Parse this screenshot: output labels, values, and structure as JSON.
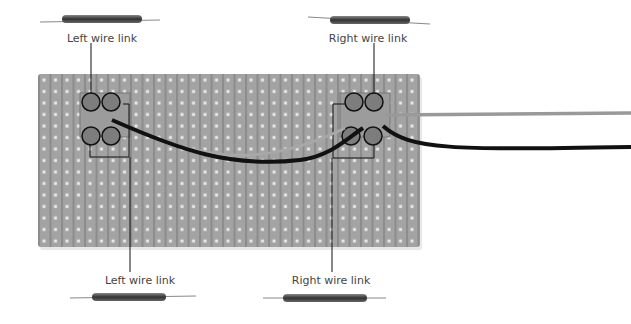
{
  "labels": {
    "top_left": "Left wire link",
    "top_right": "Right wire link",
    "bottom_left": "Left wire link",
    "bottom_right": "Right wire link"
  },
  "colors": {
    "board": "#a3a3a3",
    "strip": "#8e8e8e",
    "hole": "#e6e6e6",
    "wire_black": "#111111",
    "wire_grey": "#9a9a9a",
    "callout": "#111111"
  }
}
